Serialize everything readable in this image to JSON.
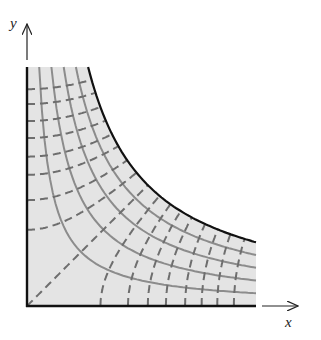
{
  "figure": {
    "axes": {
      "x_label": "x",
      "y_label": "y"
    },
    "colors": {
      "fill": "#e4e4e4",
      "boundary": "#111111",
      "solid_curves": "#8c8c8c",
      "dashed_curves": "#6e6e6e",
      "axis": "#222222"
    }
  },
  "chart_data": {
    "type": "diagram",
    "title": "",
    "xlabel": "x",
    "ylabel": "y",
    "region": {
      "x_max": 229,
      "y_max": 239,
      "boundary_curve": "xy = 14600"
    },
    "solid_family": {
      "equation": "xy = c",
      "c_values": [
        2920,
        5840,
        8760,
        11680,
        14600
      ]
    },
    "dashed_family": {
      "equation": "x^2 - y^2 = c",
      "c_values_positive": [
        5400,
        10200,
        14600,
        19300,
        25000,
        30500,
        36200,
        42800
      ],
      "c_values_negative": [
        -5800,
        -11200,
        -17200,
        -22300,
        -28200,
        -34200,
        -40800,
        -47000
      ],
      "includes_diagonal": true
    },
    "origin_px": [
      27,
      306
    ],
    "grid": false,
    "legend": null
  }
}
